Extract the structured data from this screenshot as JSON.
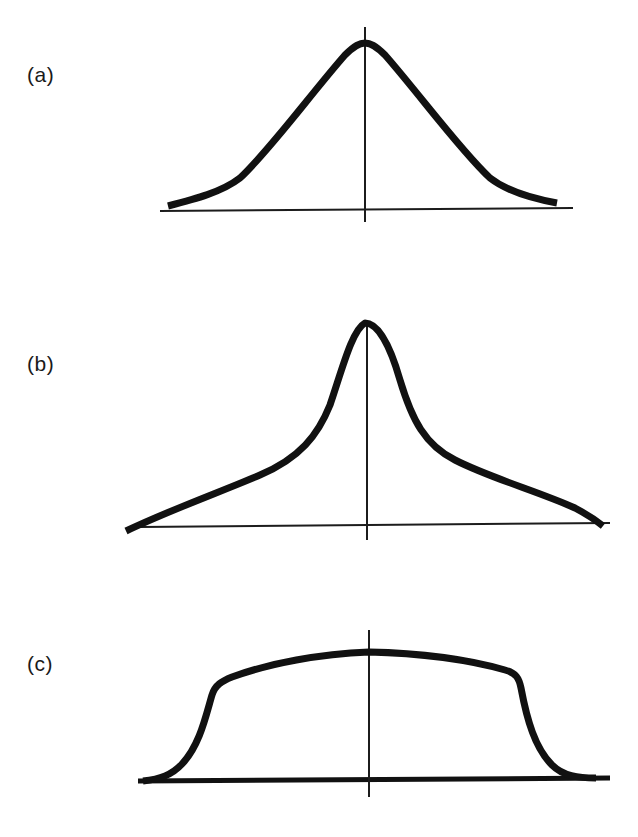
{
  "figure": {
    "panels": [
      {
        "id": "a",
        "label": "(a)",
        "description": "Bell-shaped (Gaussian-like) distribution, symmetric about the vertical axis",
        "label_position": {
          "x": 27,
          "y": 64
        },
        "vertical_axis": {
          "x": 365,
          "y1": 27,
          "y2": 222
        },
        "baseline": {
          "x1": 160,
          "y1": 211,
          "x2": 573,
          "y2": 208,
          "style": "thin"
        },
        "curve_path": "M168,206 C195,199 222,192 240,178 C270,150 310,95 345,55 C355,45 360,43 365,43 C370,43 375,45 385,55 C420,95 460,150 490,178 C508,192 535,199 557,203"
      },
      {
        "id": "b",
        "label": "(b)",
        "description": "Sharply peaked distribution with broad, heavy tails (leptokurtic)",
        "label_position": {
          "x": 27,
          "y": 353
        },
        "vertical_axis": {
          "x": 367,
          "y1": 322,
          "y2": 540
        },
        "baseline": {
          "x1": 140,
          "y1": 527,
          "x2": 610,
          "y2": 523,
          "style": "thin"
        },
        "curve_path": "M126,531 C170,510 220,492 260,475 C300,458 318,435 330,405 C342,370 352,330 365,323 C378,323 390,345 400,380 C412,420 425,445 455,460 C490,478 540,492 575,508 C590,516 598,522 603,526"
      },
      {
        "id": "c",
        "label": "(c)",
        "description": "Flat-topped (platykurtic) distribution with steep shoulders",
        "label_position": {
          "x": 27,
          "y": 653
        },
        "vertical_axis": {
          "x": 369,
          "y1": 630,
          "y2": 797
        },
        "baseline": {
          "x1": 138,
          "y1": 781,
          "x2": 610,
          "y2": 778,
          "style": "thick"
        },
        "curve_path": "M143,781 C160,779 172,775 182,764 C200,745 206,715 212,695 C215,685 222,681 232,677 C270,663 320,654 369,652 C420,653 470,660 505,670 C516,673 519,678 521,688 C527,720 535,748 552,765 C563,776 578,778 596,778"
      }
    ]
  }
}
